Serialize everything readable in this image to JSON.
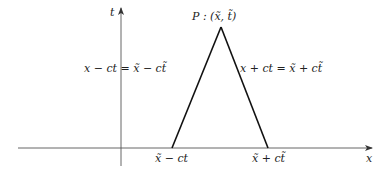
{
  "diagram": {
    "type": "characteristics-triangle",
    "axes": {
      "t_label": "t",
      "x_label": "x"
    },
    "apex": {
      "label": "P : (x̃, t̃)"
    },
    "left_characteristic": {
      "label": "x − ct = x̃ − ct̃"
    },
    "right_characteristic": {
      "label": "x + ct = x̃ + ct̃"
    },
    "base_labels": {
      "left": "x̃ − ct",
      "right": "x̃ + ct̃"
    },
    "colors": {
      "line": "#111111",
      "axis": "#444444",
      "text": "#222222"
    }
  }
}
